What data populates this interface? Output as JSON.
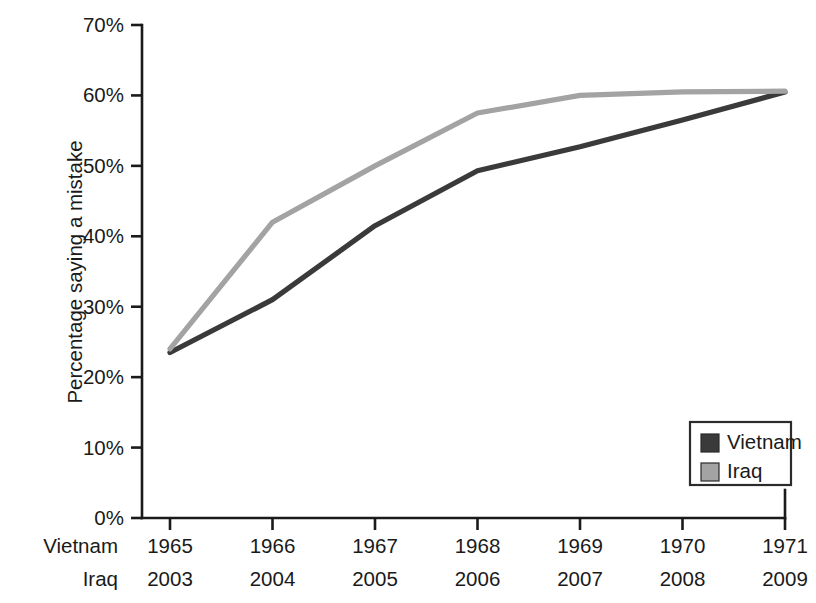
{
  "chart_data": {
    "type": "line",
    "title": "",
    "xlabel": "",
    "ylabel": "Percentage saying a mistake",
    "ylim": [
      0,
      70
    ],
    "ytick_labels": [
      "0%",
      "10%",
      "20%",
      "30%",
      "40%",
      "50%",
      "60%",
      "70%"
    ],
    "ytick_values": [
      0,
      10,
      20,
      30,
      40,
      50,
      60,
      70
    ],
    "grid": false,
    "legend_position": "bottom-right",
    "x_axis_rows": [
      {
        "name": "Vietnam",
        "ticks": [
          "1965",
          "1966",
          "1967",
          "1968",
          "1969",
          "1970",
          "1971"
        ]
      },
      {
        "name": "Iraq",
        "ticks": [
          "2003",
          "2004",
          "2005",
          "2006",
          "2007",
          "2008",
          "2009"
        ]
      }
    ],
    "x_index": [
      0,
      1,
      2,
      3,
      4,
      5,
      6
    ],
    "series": [
      {
        "name": "Vietnam",
        "color": "#3a3a3a",
        "values": [
          23.5,
          31.0,
          41.5,
          49.3,
          52.7,
          56.5,
          60.5
        ]
      },
      {
        "name": "Iraq",
        "color": "#a3a3a3",
        "values": [
          24.0,
          42.0,
          50.0,
          57.5,
          60.0,
          60.5,
          60.6
        ]
      }
    ],
    "legend": [
      {
        "label": "Vietnam",
        "color": "#3a3a3a"
      },
      {
        "label": "Iraq",
        "color": "#a3a3a3"
      }
    ]
  }
}
